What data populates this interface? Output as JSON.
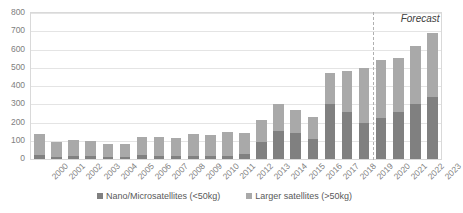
{
  "chart_data": {
    "type": "bar",
    "subtype": "stacked-column",
    "title": "",
    "xlabel": "",
    "ylabel": "",
    "ylim": [
      0,
      800
    ],
    "ytick_step": 100,
    "yticks": [
      800,
      700,
      600,
      500,
      400,
      300,
      200,
      100,
      0
    ],
    "grid": true,
    "legend_position": "bottom",
    "categories": [
      "2000",
      "2001",
      "2002",
      "2003",
      "2004",
      "2005",
      "2006",
      "2007",
      "2008",
      "2009",
      "2010",
      "2011",
      "2012",
      "2013",
      "2014",
      "2015",
      "2016",
      "2017",
      "2018",
      "2019",
      "2020",
      "2021",
      "2022",
      "2023"
    ],
    "series": [
      {
        "name": "Nano/Microsatellites (<50kg)",
        "color": "#808080",
        "values": [
          20,
          12,
          15,
          14,
          10,
          10,
          20,
          18,
          15,
          18,
          17,
          18,
          30,
          95,
          155,
          140,
          110,
          300,
          260,
          195,
          225,
          260,
          300,
          340
        ]
      },
      {
        "name": "Larger satellites (>50kg)",
        "color": "#a9a9a9",
        "values": [
          115,
          83,
          87,
          84,
          70,
          72,
          98,
          103,
          98,
          118,
          115,
          128,
          112,
          120,
          148,
          128,
          118,
          172,
          220,
          302,
          315,
          293,
          320,
          348
        ]
      }
    ],
    "totals": [
      135,
      95,
      102,
      98,
      80,
      82,
      118,
      121,
      113,
      136,
      132,
      146,
      142,
      215,
      303,
      268,
      228,
      472,
      480,
      497,
      540,
      553,
      620,
      688
    ],
    "annotations": [
      {
        "text": "Forecast",
        "after_category": "2019",
        "style": "italic"
      }
    ],
    "forecast_start_category": "2020"
  },
  "legend": {
    "items": [
      {
        "label": "Nano/Microsatellites (<50kg)",
        "color": "#808080"
      },
      {
        "label": "Larger satellites (>50kg)",
        "color": "#a9a9a9"
      }
    ]
  },
  "colors": {
    "nano": "#808080",
    "larger": "#a9a9a9",
    "grid": "#e4e4e4",
    "frame": "#d9d9d9",
    "axis_text": "#808080",
    "annotation_text": "#404040"
  }
}
